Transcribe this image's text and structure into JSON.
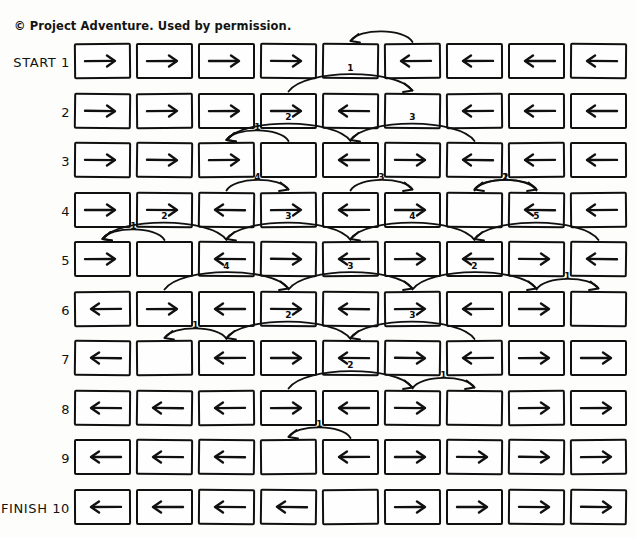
{
  "sheet": {
    "copyright": "© Project Adventure. Used by permission.",
    "ink_color": "#101010",
    "paper_color": "#fdfdfb"
  },
  "legend": {
    "arrow_right": "right-arrow",
    "arrow_left": "left-arrow",
    "empty": "empty-cell"
  },
  "grid": {
    "columns": 9,
    "rows_count": 10,
    "rows": [
      {
        "number": "1",
        "prefix": "START",
        "label": "START 1",
        "cells": [
          "right",
          "right",
          "right",
          "right",
          "empty",
          "left",
          "left",
          "left",
          "left"
        ],
        "moves": [
          {
            "label": "",
            "from": 6,
            "to": 5
          }
        ]
      },
      {
        "number": "2",
        "prefix": "",
        "label": "2",
        "cells": [
          "right",
          "right",
          "right",
          "right",
          "left",
          "empty",
          "left",
          "left",
          "left"
        ],
        "moves": [
          {
            "label": "1",
            "from": 4,
            "to": 6
          }
        ]
      },
      {
        "number": "3",
        "prefix": "",
        "label": "3",
        "cells": [
          "right",
          "right",
          "right",
          "empty",
          "left",
          "right",
          "left",
          "left",
          "left"
        ],
        "moves": [
          {
            "label": "1",
            "from": 4,
            "to": 3
          },
          {
            "label": "2",
            "from": 5,
            "to": 3
          },
          {
            "label": "3",
            "from": 7,
            "to": 5
          }
        ]
      },
      {
        "number": "4",
        "prefix": "",
        "label": "4",
        "cells": [
          "right",
          "right",
          "left",
          "right",
          "left",
          "right",
          "empty",
          "left",
          "left"
        ],
        "moves": [
          {
            "label": "4",
            "from": 3,
            "to": 4
          },
          {
            "label": "3",
            "from": 5,
            "to": 6
          },
          {
            "label": "2",
            "from": 7,
            "to": 8
          },
          {
            "label": "1",
            "from": 8,
            "to": 7
          }
        ]
      },
      {
        "number": "5",
        "prefix": "",
        "label": "5",
        "cells": [
          "right",
          "empty",
          "left",
          "right",
          "left",
          "right",
          "left",
          "right",
          "left"
        ],
        "moves": [
          {
            "label": "1",
            "from": 2,
            "to": 1
          },
          {
            "label": "2",
            "from": 3,
            "to": 1
          },
          {
            "label": "3",
            "from": 5,
            "to": 3
          },
          {
            "label": "4",
            "from": 7,
            "to": 5
          },
          {
            "label": "5",
            "from": 9,
            "to": 7
          }
        ]
      },
      {
        "number": "6",
        "prefix": "",
        "label": "6",
        "cells": [
          "left",
          "right",
          "left",
          "right",
          "left",
          "right",
          "left",
          "right",
          "empty"
        ],
        "moves": [
          {
            "label": "4",
            "from": 2,
            "to": 4
          },
          {
            "label": "3",
            "from": 4,
            "to": 6
          },
          {
            "label": "2",
            "from": 6,
            "to": 8
          },
          {
            "label": "1",
            "from": 8,
            "to": 9
          }
        ]
      },
      {
        "number": "7",
        "prefix": "",
        "label": "7",
        "cells": [
          "left",
          "empty",
          "left",
          "right",
          "left",
          "right",
          "left",
          "right",
          "right"
        ],
        "moves": [
          {
            "label": "1",
            "from": 3,
            "to": 2
          },
          {
            "label": "2",
            "from": 5,
            "to": 3
          },
          {
            "label": "3",
            "from": 7,
            "to": 5
          }
        ]
      },
      {
        "number": "8",
        "prefix": "",
        "label": "8",
        "cells": [
          "left",
          "left",
          "left",
          "right",
          "left",
          "right",
          "empty",
          "right",
          "right"
        ],
        "moves": [
          {
            "label": "2",
            "from": 4,
            "to": 6
          },
          {
            "label": "1",
            "from": 6,
            "to": 7
          }
        ]
      },
      {
        "number": "9",
        "prefix": "",
        "label": "9",
        "cells": [
          "left",
          "left",
          "left",
          "empty",
          "left",
          "right",
          "right",
          "right",
          "right"
        ],
        "moves": [
          {
            "label": "1",
            "from": 5,
            "to": 4
          }
        ]
      },
      {
        "number": "10",
        "prefix": "FINISH",
        "label": "FINISH 10",
        "cells": [
          "left",
          "left",
          "left",
          "left",
          "empty",
          "right",
          "right",
          "right",
          "right"
        ],
        "moves": []
      }
    ]
  }
}
